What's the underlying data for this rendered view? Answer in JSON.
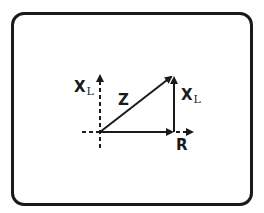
{
  "diagram": {
    "type": "impedance-triangle",
    "labels": {
      "axis_y_main": "X",
      "axis_y_sub": "L",
      "hypotenuse": "Z",
      "vertical_main": "X",
      "vertical_sub": "L",
      "horizontal": "R"
    },
    "colors": {
      "line": "#1a1a1a",
      "background": "#ffffff"
    }
  }
}
